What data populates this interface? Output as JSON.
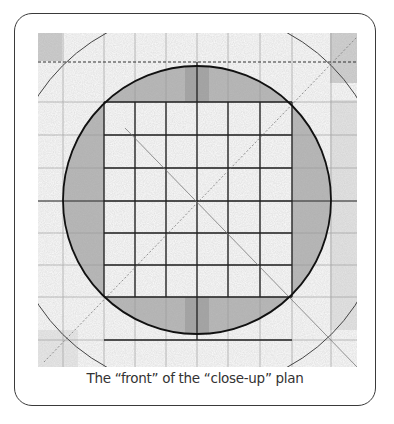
{
  "figure": {
    "caption": "The “front” of the  “close-up” plan",
    "colors": {
      "frame_border": "#3a3a3a",
      "ink": "#1a1a1a",
      "shading": "#9a9a9a",
      "paper": "#ffffff",
      "caption_text": "#333333"
    },
    "drawing": {
      "bounds": {
        "x": 38,
        "y": 33,
        "width": 319,
        "height": 334
      },
      "circle": {
        "cx": 197,
        "cy": 200,
        "r": 134
      },
      "inner_square": {
        "x1": 104,
        "y1": 102,
        "x2": 292,
        "y2": 297
      },
      "grid_vertical_x": [
        63,
        104,
        135,
        166,
        197,
        228,
        260,
        292,
        331
      ],
      "grid_horizontal_y": [
        62,
        102,
        135,
        168,
        201,
        233,
        265,
        297,
        340
      ]
    }
  }
}
